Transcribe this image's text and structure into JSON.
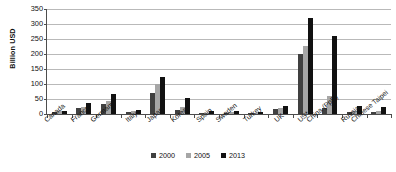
{
  "chart_data": {
    "type": "bar",
    "title": "",
    "subtitle": "",
    "xlabel": "",
    "ylabel": "Billion USD",
    "ylim": [
      0,
      350
    ],
    "y_ticks": [
      0,
      50,
      100,
      150,
      200,
      250,
      300,
      350
    ],
    "grid": true,
    "legend_position": "bottom",
    "categories": [
      "Canada",
      "France",
      "Germany",
      "Italy",
      "Japan",
      "Korea",
      "Spain",
      "Sweden",
      "Turkey",
      "UK",
      "US*",
      "China (PpR)",
      "Russia",
      "Chinese Taipei"
    ],
    "series": [
      {
        "name": "2000",
        "color": "#404040",
        "values": [
          8,
          19,
          35,
          7,
          70,
          13,
          3,
          5,
          1,
          18,
          201,
          20,
          7,
          6
        ]
      },
      {
        "name": "2005",
        "color": "#a6a6a6",
        "values": [
          10,
          22,
          44,
          10,
          101,
          22,
          5,
          7,
          2,
          21,
          227,
          60,
          11,
          9
        ]
      },
      {
        "name": "2013",
        "color": "#111111",
        "values": [
          9,
          36,
          67,
          13,
          122,
          55,
          11,
          10,
          7,
          27,
          320,
          261,
          27,
          23
        ]
      }
    ]
  },
  "legend": {
    "items": [
      {
        "label": "2000"
      },
      {
        "label": "2005"
      },
      {
        "label": "2013"
      }
    ]
  }
}
